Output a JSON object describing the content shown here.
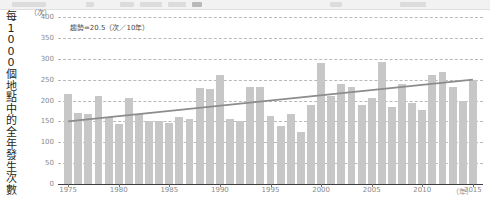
{
  "toolbar": {
    "present": true
  },
  "axis_title_vertical": "每1000個地點中的全年發生次數",
  "y_unit": "（次）",
  "x_unit": "（年）",
  "annotation": "趨勢=20.5（次／10年）",
  "colors": {
    "bar": "#c7c7c7",
    "trend_line": "#8c8c8c",
    "gridline": "#b9b9b9",
    "axis": "#3f3f3f",
    "tick_text": "#8a8a8a",
    "title_text": "#231f20"
  },
  "chart_data": {
    "type": "bar",
    "title": "",
    "subtitle": "",
    "xlabel": "（年）",
    "ylabel": "每1000個地點中的全年發生次數",
    "y_axis_unit": "（次）",
    "ylim": [
      0,
      400
    ],
    "xlim": [
      1974,
      2016
    ],
    "y_ticks": [
      0,
      50,
      100,
      150,
      200,
      250,
      300,
      350,
      400
    ],
    "x_ticks": [
      1975,
      1980,
      1985,
      1990,
      1995,
      2000,
      2005,
      2010,
      2015
    ],
    "grid": true,
    "legend": "none",
    "annotations": [
      {
        "text": "趨勢=20.5（次／10年）",
        "x": 1981,
        "y": 362
      }
    ],
    "categories": [
      1975,
      1976,
      1977,
      1978,
      1979,
      1980,
      1981,
      1982,
      1983,
      1984,
      1985,
      1986,
      1987,
      1988,
      1989,
      1990,
      1991,
      1992,
      1993,
      1994,
      1995,
      1996,
      1997,
      1998,
      1999,
      2000,
      2001,
      2002,
      2003,
      2004,
      2005,
      2006,
      2007,
      2008,
      2009,
      2010,
      2011,
      2012,
      2013,
      2014,
      2015
    ],
    "values": [
      215,
      170,
      168,
      212,
      160,
      143,
      205,
      168,
      150,
      152,
      145,
      160,
      155,
      230,
      228,
      262,
      155,
      150,
      232,
      233,
      162,
      140,
      168,
      125,
      190,
      290,
      210,
      240,
      232,
      190,
      205,
      292,
      185,
      240,
      195,
      178,
      262,
      268,
      232,
      200,
      250
    ],
    "trend": {
      "label": "趨勢=20.5（次／10年）",
      "slope_per_decade": 20.5,
      "start": {
        "x": 1975,
        "y": 150
      },
      "end": {
        "x": 2015,
        "y": 250
      }
    }
  }
}
